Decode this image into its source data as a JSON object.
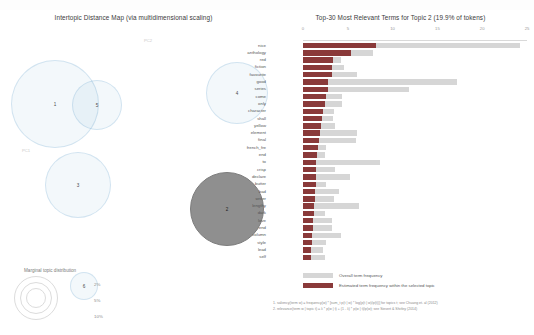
{
  "left_panel": {
    "title": "Intertopic Distance Map (via multidimensional scaling)",
    "axis_x_label": "PC1",
    "axis_y_label": "PC2",
    "legend_title": "Marginal topic distribution",
    "size_legend": [
      "2%",
      "5%",
      "10%"
    ]
  },
  "right_panel": {
    "title": "Top-30 Most Relevant Terms for Topic 2 (19.9% of tokens)",
    "legend": {
      "overall": "Overall term frequency",
      "selected": "Estimated term frequency within the selected topic"
    },
    "notes": [
      "1. saliency(term w) = frequency(w) * [sum_t p(t | w) * log(p(t | w)/p(t))] for topics t; see Chuang et. al (2012)",
      "2. relevance(term w | topic t) = λ * p(w | t) + (1 - λ) * p(w | t)/p(w); see Sievert & Shirley (2014)"
    ]
  },
  "chart_data": {
    "type": "bar",
    "title": "Top-30 Most Relevant Terms for Topic 2 (19.9% of tokens)",
    "xlabel": "",
    "ylabel": "",
    "xlim": [
      0,
      25
    ],
    "xticks": [
      0,
      5,
      10,
      15,
      20,
      25
    ],
    "grid": false,
    "legend_position": "bottom-left",
    "orientation": "horizontal",
    "categories": [
      "nice",
      "anthology",
      "red",
      "fiction",
      "favourite",
      "good",
      "series",
      "come",
      "only",
      "character",
      "shall",
      "yellow",
      "element",
      "final",
      "french_fre",
      "end",
      "to",
      "crisp",
      "declare",
      "butter",
      "bad",
      "writer",
      "lengthy",
      "dark",
      "love",
      "end",
      "column",
      "style",
      "lead",
      "self"
    ],
    "series": [
      {
        "name": "Overall term frequency",
        "values": [
          24.2,
          7.8,
          4.2,
          4.6,
          6.0,
          17.2,
          11.8,
          4.4,
          4.4,
          3.5,
          3.3,
          3.6,
          6.0,
          5.9,
          2.6,
          2.4,
          8.6,
          3.6,
          5.2,
          2.6,
          4.0,
          3.5,
          6.2,
          2.4,
          3.2,
          3.2,
          4.2,
          2.6,
          2.2,
          2.4
        ]
      },
      {
        "name": "Estimated term frequency within the selected topic",
        "values": [
          8.2,
          5.4,
          3.3,
          3.2,
          3.2,
          2.8,
          2.8,
          2.6,
          2.4,
          2.2,
          2.1,
          2.0,
          1.9,
          1.8,
          1.7,
          1.6,
          1.5,
          1.5,
          1.4,
          1.4,
          1.3,
          1.3,
          1.2,
          1.2,
          1.1,
          1.1,
          1.0,
          1.0,
          0.9,
          0.9
        ]
      }
    ],
    "colors": {
      "overall": "#d6d6d6",
      "selected": "#8a3a3a"
    }
  },
  "topics": [
    {
      "id": "1",
      "x": 11,
      "y": 36,
      "r": 44,
      "selected": false
    },
    {
      "id": "5",
      "x": 72,
      "y": 56,
      "r": 25,
      "selected": false
    },
    {
      "id": "4",
      "x": 206,
      "y": 38,
      "r": 31,
      "selected": false
    },
    {
      "id": "3",
      "x": 45,
      "y": 128,
      "r": 33,
      "selected": false
    },
    {
      "id": "6",
      "x": 70,
      "y": 248,
      "r": 14,
      "selected": false
    },
    {
      "id": "2",
      "x": 190,
      "y": 148,
      "r": 37,
      "selected": true
    }
  ]
}
